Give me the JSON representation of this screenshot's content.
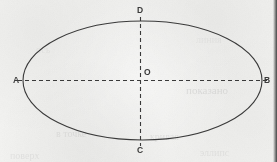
{
  "figure": {
    "kind": "ellipse-with-axes-diagram",
    "background_color": "#f1f1ef",
    "ink_color": "#3a3a3a",
    "ellipse": {
      "center_x": 142.5,
      "center_y": 80.5,
      "radius_x": 119.5,
      "radius_y": 59.5,
      "stroke_width": 1.1
    },
    "axes": {
      "dash_pattern": "4 3",
      "stroke_width": 1.1,
      "major_axis": {
        "name": "horizontal-axis",
        "x1": 18,
        "y1": 80.5,
        "x2": 268,
        "y2": 80.5
      },
      "minor_axis": {
        "name": "vertical-axis",
        "x1": 140.5,
        "y1": 17,
        "x2": 140.5,
        "y2": 146
      }
    },
    "points": [
      {
        "label": "A",
        "role": "left-vertex",
        "x": 23,
        "y": 80.5,
        "label_x": 13,
        "label_y": 76
      },
      {
        "label": "B",
        "role": "right-vertex",
        "x": 262,
        "y": 80.5,
        "label_x": 264,
        "label_y": 76
      },
      {
        "label": "C",
        "role": "bottom-vertex",
        "x": 140.5,
        "y": 140,
        "label_x": 137,
        "label_y": 146
      },
      {
        "label": "D",
        "role": "top-vertex",
        "x": 140.5,
        "y": 21,
        "label_x": 137,
        "label_y": 6
      },
      {
        "label": "O",
        "role": "center",
        "x": 142.5,
        "y": 80.5,
        "label_x": 144,
        "label_y": 68
      }
    ]
  },
  "ghost_marks": [
    {
      "text": "показано",
      "x": 186,
      "y": 84,
      "size": 11,
      "opacity": 0.26
    },
    {
      "text": "в точке",
      "x": 56,
      "y": 128,
      "size": 10,
      "opacity": 0.2
    },
    {
      "text": "кривая",
      "x": 150,
      "y": 131,
      "size": 10,
      "opacity": 0.2
    },
    {
      "text": "поверх",
      "x": 10,
      "y": 150,
      "size": 10,
      "opacity": 0.18
    },
    {
      "text": "эллипс",
      "x": 200,
      "y": 147,
      "size": 10,
      "opacity": 0.18
    },
    {
      "text": "ось",
      "x": 36,
      "y": 44,
      "size": 10,
      "opacity": 0.12
    },
    {
      "text": "линия",
      "x": 196,
      "y": 34,
      "size": 10,
      "opacity": 0.12
    }
  ]
}
